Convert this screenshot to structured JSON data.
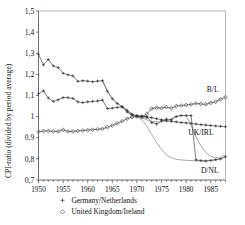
{
  "chart_data": {
    "type": "line",
    "title": "",
    "xlabel": "",
    "ylabel": "CPI-ratio (divided by period average)",
    "xlim": [
      1950,
      1988
    ],
    "ylim": [
      0.7,
      1.5
    ],
    "yticks": [
      0.7,
      0.8,
      0.9,
      1.0,
      1.1,
      1.2,
      1.3,
      1.4,
      1.5
    ],
    "ytick_labels": [
      "0,7",
      "0,8",
      "0,9",
      "1",
      "1,1",
      "1,2",
      "1,3",
      "1,4",
      "1,5"
    ],
    "xticks": [
      1950,
      1955,
      1960,
      1965,
      1970,
      1975,
      1980,
      1985
    ],
    "xtick_labels": [
      "1950",
      "1955",
      "1960",
      "1965",
      "1970",
      "1975",
      "1980",
      "1985"
    ],
    "grid": false,
    "legend_position": "below",
    "legend": [
      {
        "marker": "plus",
        "label": "Germany/Netherlands"
      },
      {
        "marker": "diamond",
        "label": "United Kingdom/Ireland"
      }
    ],
    "annotations": [
      {
        "text": "B/L",
        "x": 1985.4,
        "y": 1.115
      },
      {
        "text": "UK/IRL",
        "x": 1983.0,
        "y": 0.912
      },
      {
        "text": "D/NL",
        "x": 1984.8,
        "y": 0.735
      }
    ],
    "series": [
      {
        "name": "B/L",
        "marker": "plus",
        "annotation": "B/L",
        "x": [
          1950,
          1951,
          1952,
          1953,
          1954,
          1955,
          1956,
          1957,
          1958,
          1959,
          1960,
          1961,
          1962,
          1963,
          1964,
          1965,
          1966,
          1967,
          1968,
          1969,
          1970,
          1971,
          1972,
          1973,
          1974,
          1975,
          1976,
          1977,
          1978,
          1979,
          1980,
          1981,
          1982,
          1983,
          1984,
          1985,
          1986,
          1987,
          1988
        ],
        "values": [
          1.295,
          1.245,
          1.27,
          1.24,
          1.232,
          1.205,
          1.198,
          1.193,
          1.167,
          1.17,
          1.168,
          1.165,
          1.168,
          1.17,
          1.12,
          1.085,
          1.062,
          1.048,
          1.03,
          1.012,
          1.002,
          1.0,
          0.998,
          0.995,
          0.99,
          0.985,
          0.98,
          0.978,
          0.975,
          0.972,
          0.97,
          0.968,
          0.965,
          0.962,
          0.96,
          0.958,
          0.956,
          0.954,
          0.952
        ]
      },
      {
        "name": "D/NL",
        "marker": "plus",
        "annotation": "D/NL",
        "x": [
          1950,
          1951,
          1952,
          1953,
          1954,
          1955,
          1956,
          1957,
          1958,
          1959,
          1960,
          1961,
          1962,
          1963,
          1964,
          1965,
          1966,
          1967,
          1968,
          1969,
          1970,
          1971,
          1972,
          1973,
          1974,
          1975,
          1976,
          1977,
          1978,
          1979,
          1980,
          1981,
          1982,
          1983,
          1984,
          1985,
          1986,
          1987,
          1988
        ],
        "values": [
          1.108,
          1.122,
          1.088,
          1.072,
          1.08,
          1.09,
          1.09,
          1.086,
          1.07,
          1.066,
          1.07,
          1.072,
          1.074,
          1.078,
          1.038,
          1.04,
          1.044,
          1.045,
          1.022,
          1.008,
          1.005,
          1.003,
          0.998,
          0.972,
          0.965,
          0.98,
          0.988,
          0.985,
          1.0,
          1.005,
          1.005,
          1.005,
          0.795,
          0.792,
          0.79,
          0.793,
          0.796,
          0.8,
          0.81
        ]
      },
      {
        "name": "UK/IRL",
        "marker": "diamond",
        "annotation": "UK/IRL",
        "x": [
          1950,
          1951,
          1952,
          1953,
          1954,
          1955,
          1956,
          1957,
          1958,
          1959,
          1960,
          1961,
          1962,
          1963,
          1964,
          1965,
          1966,
          1967,
          1968,
          1969,
          1970,
          1971,
          1972,
          1973,
          1974,
          1975,
          1976,
          1977,
          1978,
          1979,
          1980,
          1981,
          1982,
          1983,
          1984,
          1985,
          1986,
          1987,
          1988
        ],
        "values": [
          0.928,
          0.932,
          0.932,
          0.93,
          0.93,
          0.938,
          0.93,
          0.93,
          0.932,
          0.934,
          0.936,
          0.938,
          0.94,
          0.942,
          0.95,
          0.958,
          0.968,
          0.978,
          0.99,
          0.998,
          1.0,
          0.998,
          1.012,
          1.038,
          1.042,
          1.04,
          1.045,
          1.04,
          1.05,
          1.052,
          1.055,
          1.058,
          1.062,
          1.06,
          1.058,
          1.065,
          1.07,
          1.082,
          1.092
        ]
      },
      {
        "name": "UK/IRL-thin",
        "marker": "none",
        "annotation": "",
        "x": [
          1963,
          1964,
          1965,
          1966,
          1967,
          1968,
          1969,
          1970,
          1971,
          1972,
          1973,
          1974,
          1975,
          1976,
          1977,
          1978,
          1979,
          1980,
          1981,
          1982,
          1983,
          1984,
          1985,
          1986,
          1987,
          1988
        ],
        "values": [
          1.17,
          1.12,
          1.085,
          1.062,
          1.048,
          1.03,
          1.012,
          1.002,
          0.995,
          0.985,
          0.978,
          0.975,
          0.975,
          0.978,
          0.99,
          1.002,
          1.005,
          1.005,
          0.96,
          0.905,
          0.862,
          0.83,
          0.812,
          0.805,
          0.805,
          0.822
        ]
      },
      {
        "name": "D/NL-thin",
        "marker": "none",
        "annotation": "",
        "x": [
          1968,
          1969,
          1970,
          1971,
          1972,
          1973,
          1974,
          1975,
          1976,
          1977,
          1978,
          1979,
          1980,
          1981,
          1982,
          1983,
          1984,
          1985,
          1986,
          1987,
          1988
        ],
        "values": [
          1.022,
          1.008,
          1.0,
          0.985,
          0.955,
          0.915,
          0.878,
          0.845,
          0.818,
          0.805,
          0.798,
          0.795,
          0.793,
          0.792,
          0.791,
          0.79,
          0.79,
          0.792,
          0.795,
          0.8,
          0.81
        ]
      }
    ]
  },
  "axis": {
    "ylabel": "CPI-ratio (divided by period average)"
  }
}
